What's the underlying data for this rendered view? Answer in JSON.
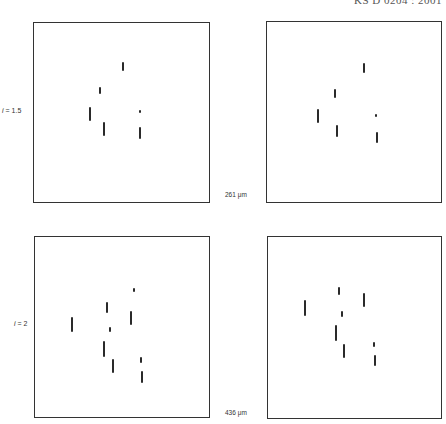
{
  "header": {
    "text": "KS D 0204 : 2001"
  },
  "rows": [
    {
      "label_var": "i",
      "label_eq": " = 1.5",
      "scale_label": "261 μm"
    },
    {
      "label_var": "i",
      "label_eq": " = 2",
      "scale_label": "436 μm"
    }
  ],
  "panels": [
    {
      "box": {
        "left": 33,
        "top": 22,
        "width": 177,
        "height": 181
      },
      "marks": [
        {
          "x": 123,
          "y1": 62,
          "y2": 71
        },
        {
          "x": 100,
          "y1": 87,
          "y2": 94
        },
        {
          "x": 90,
          "y1": 107,
          "y2": 121
        },
        {
          "x": 104,
          "y1": 122,
          "y2": 136
        },
        {
          "x": 140,
          "y1": 110,
          "y2": 113
        },
        {
          "x": 140,
          "y1": 127,
          "y2": 139
        }
      ]
    },
    {
      "box": {
        "left": 266,
        "top": 21,
        "width": 176,
        "height": 182
      },
      "marks": [
        {
          "x": 364,
          "y1": 63,
          "y2": 73
        },
        {
          "x": 335,
          "y1": 89,
          "y2": 98
        },
        {
          "x": 318,
          "y1": 109,
          "y2": 123
        },
        {
          "x": 337,
          "y1": 125,
          "y2": 137
        },
        {
          "x": 376,
          "y1": 114,
          "y2": 117
        },
        {
          "x": 377,
          "y1": 132,
          "y2": 143
        }
      ]
    },
    {
      "box": {
        "left": 34,
        "top": 236,
        "width": 176,
        "height": 182
      },
      "marks": [
        {
          "x": 134,
          "y1": 288,
          "y2": 292
        },
        {
          "x": 107,
          "y1": 302,
          "y2": 313
        },
        {
          "x": 131,
          "y1": 311,
          "y2": 325
        },
        {
          "x": 72,
          "y1": 317,
          "y2": 332
        },
        {
          "x": 110,
          "y1": 327,
          "y2": 332
        },
        {
          "x": 104,
          "y1": 341,
          "y2": 357
        },
        {
          "x": 113,
          "y1": 359,
          "y2": 373
        },
        {
          "x": 141,
          "y1": 357,
          "y2": 363
        },
        {
          "x": 142,
          "y1": 371,
          "y2": 383
        }
      ]
    },
    {
      "box": {
        "left": 267,
        "top": 236,
        "width": 175,
        "height": 183
      },
      "marks": [
        {
          "x": 339,
          "y1": 287,
          "y2": 295
        },
        {
          "x": 364,
          "y1": 293,
          "y2": 307
        },
        {
          "x": 305,
          "y1": 300,
          "y2": 316
        },
        {
          "x": 342,
          "y1": 311,
          "y2": 317
        },
        {
          "x": 336,
          "y1": 325,
          "y2": 341
        },
        {
          "x": 344,
          "y1": 344,
          "y2": 358
        },
        {
          "x": 374,
          "y1": 342,
          "y2": 347
        },
        {
          "x": 375,
          "y1": 355,
          "y2": 366
        }
      ]
    }
  ]
}
